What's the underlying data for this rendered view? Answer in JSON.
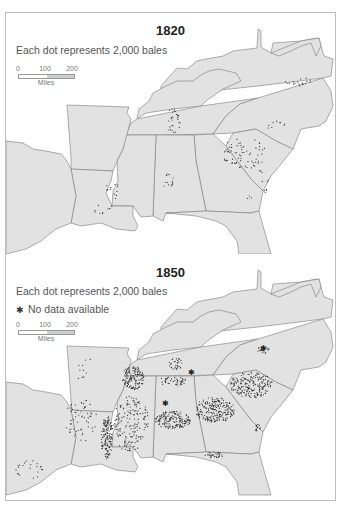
{
  "colors": {
    "land": "#e2e2e2",
    "border": "#7a7a7a",
    "dot": "#333333",
    "background": "#ffffff",
    "frame": "#bdbdbd"
  },
  "panels": [
    {
      "id": "1820",
      "title": "1820",
      "legend": "Each dot represents 2,000 bales",
      "no_data_label": null,
      "scale": {
        "ticks": [
          "0",
          "100",
          "200"
        ],
        "unit": "Miles"
      },
      "clusters": [
        {
          "region": "North Carolina / Virginia border",
          "cx": 298,
          "cy": 80,
          "rx": 14,
          "ry": 5,
          "n": 18
        },
        {
          "region": "North Carolina piedmont",
          "cx": 275,
          "cy": 125,
          "rx": 10,
          "ry": 6,
          "n": 9
        },
        {
          "region": "South Carolina / Georgia upcountry",
          "cx": 243,
          "cy": 152,
          "rx": 22,
          "ry": 16,
          "n": 70
        },
        {
          "region": "South Carolina coast",
          "cx": 262,
          "cy": 180,
          "rx": 6,
          "ry": 14,
          "n": 10
        },
        {
          "region": "Middle Tennessee",
          "cx": 172,
          "cy": 120,
          "rx": 8,
          "ry": 13,
          "n": 28
        },
        {
          "region": "North Alabama",
          "cx": 168,
          "cy": 178,
          "rx": 8,
          "ry": 9,
          "n": 14
        },
        {
          "region": "Mississippi river / Natchez",
          "cx": 112,
          "cy": 190,
          "rx": 8,
          "ry": 10,
          "n": 12
        },
        {
          "region": "Louisiana",
          "cx": 102,
          "cy": 208,
          "rx": 10,
          "ry": 6,
          "n": 10
        },
        {
          "region": "Georgia coast",
          "cx": 250,
          "cy": 195,
          "rx": 4,
          "ry": 6,
          "n": 3
        }
      ],
      "no_data_markers": []
    },
    {
      "id": "1850",
      "title": "1850",
      "legend": "Each dot represents 2,000 bales",
      "no_data_label": "No data available",
      "scale": {
        "ticks": [
          "0",
          "100",
          "200"
        ],
        "unit": "Miles"
      },
      "clusters": [
        {
          "region": "Mississippi delta",
          "cx": 106,
          "cy": 437,
          "rx": 6,
          "ry": 22,
          "n": 150
        },
        {
          "region": "West Tennessee / North Mississippi",
          "cx": 132,
          "cy": 378,
          "rx": 11,
          "ry": 12,
          "n": 140
        },
        {
          "region": "Mississippi interior",
          "cx": 130,
          "cy": 420,
          "rx": 18,
          "ry": 24,
          "n": 140
        },
        {
          "region": "Middle Tennessee",
          "cx": 175,
          "cy": 364,
          "rx": 7,
          "ry": 6,
          "n": 30
        },
        {
          "region": "North Alabama",
          "cx": 172,
          "cy": 381,
          "rx": 14,
          "ry": 5,
          "n": 45
        },
        {
          "region": "Alabama black belt",
          "cx": 172,
          "cy": 420,
          "rx": 18,
          "ry": 9,
          "n": 170
        },
        {
          "region": "Georgia piedmont",
          "cx": 214,
          "cy": 410,
          "rx": 20,
          "ry": 13,
          "n": 220
        },
        {
          "region": "South Carolina upcountry",
          "cx": 250,
          "cy": 385,
          "rx": 22,
          "ry": 13,
          "n": 200
        },
        {
          "region": "North Carolina",
          "cx": 262,
          "cy": 350,
          "rx": 6,
          "ry": 4,
          "n": 20
        },
        {
          "region": "South Georgia / Florida border",
          "cx": 213,
          "cy": 455,
          "rx": 9,
          "ry": 4,
          "n": 30
        },
        {
          "region": "Louisiana / Arkansas scatter",
          "cx": 80,
          "cy": 420,
          "rx": 16,
          "ry": 22,
          "n": 60
        },
        {
          "region": "East Texas",
          "cx": 28,
          "cy": 470,
          "rx": 14,
          "ry": 10,
          "n": 22
        },
        {
          "region": "Arkansas",
          "cx": 82,
          "cy": 370,
          "rx": 14,
          "ry": 16,
          "n": 10
        },
        {
          "region": "Georgia coast / Savannah",
          "cx": 257,
          "cy": 428,
          "rx": 3,
          "ry": 4,
          "n": 14
        },
        {
          "region": "Mississippi south",
          "cx": 128,
          "cy": 446,
          "rx": 10,
          "ry": 5,
          "n": 25
        }
      ],
      "no_data_markers": [
        {
          "x": 164,
          "y": 403
        },
        {
          "x": 262,
          "y": 348
        },
        {
          "x": 190,
          "y": 372
        }
      ]
    }
  ]
}
